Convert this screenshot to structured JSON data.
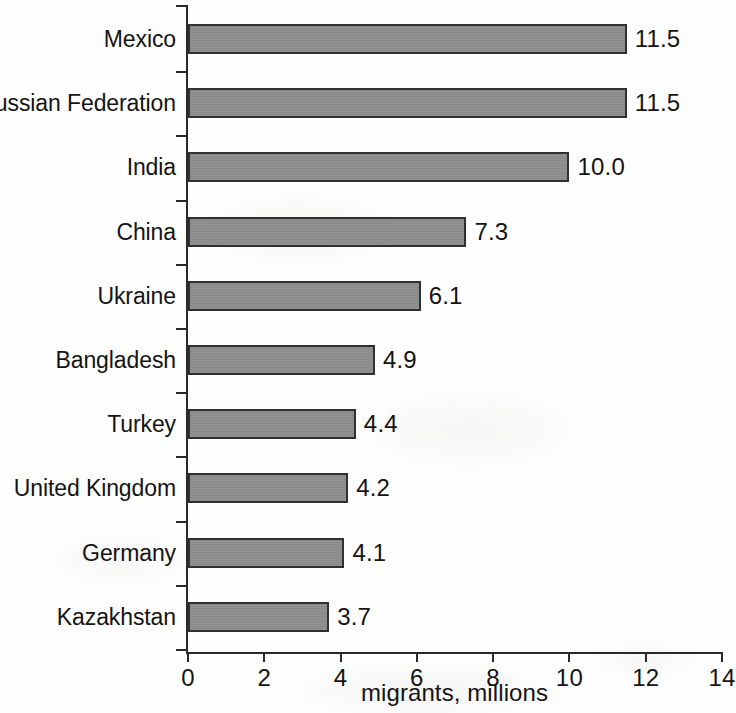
{
  "chart_data": {
    "type": "bar",
    "orientation": "horizontal",
    "title": "",
    "xlabel": "migrants, millions",
    "ylabel": "",
    "categories": [
      "Mexico",
      "Russian Federation",
      "India",
      "China",
      "Ukraine",
      "Bangladesh",
      "Turkey",
      "United Kingdom",
      "Germany",
      "Kazakhstan"
    ],
    "values": [
      11.5,
      11.5,
      10.0,
      7.3,
      6.1,
      4.9,
      4.4,
      4.2,
      4.1,
      3.7
    ],
    "value_labels": [
      "11.5",
      "11.5",
      "10.0",
      "7.3",
      "6.1",
      "4.9",
      "4.4",
      "4.2",
      "4.1",
      "3.7"
    ],
    "xlim": [
      0,
      14
    ],
    "xticks": [
      0,
      2,
      4,
      6,
      8,
      10,
      12,
      14
    ],
    "xtick_labels": [
      "0",
      "2",
      "4",
      "6",
      "8",
      "10",
      "12",
      "14"
    ],
    "grid": false,
    "legend": null,
    "bar_color": "#8d8d8d",
    "bar_edge_color": "#303030",
    "text_color": "#141414",
    "axis_color": "#2a2a2a",
    "background_color": "#ffffff"
  }
}
